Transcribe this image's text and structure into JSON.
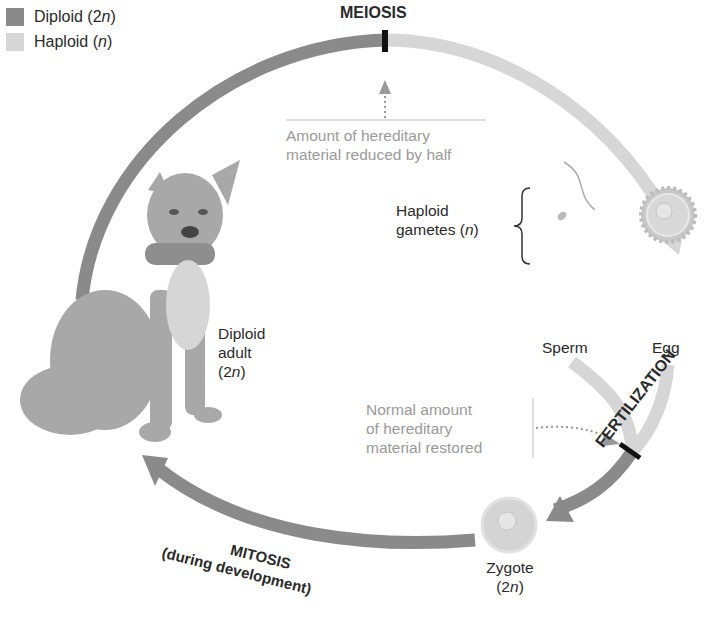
{
  "legend": [
    {
      "label": "Diploid (2",
      "suffix_italic": "n",
      "close": ")",
      "color": "#8a8a8a"
    },
    {
      "label": "Haploid (",
      "suffix_italic": "n",
      "close": ")",
      "color": "#d6d6d6"
    }
  ],
  "stages": {
    "meiosis": "MEIOSIS",
    "fertilization": "FERTILIZATION",
    "mitosis": "MITOSIS",
    "mitosis_sub": "(during development)"
  },
  "notes": {
    "meiosis_note_line1": "Amount of hereditary",
    "meiosis_note_line2": "material reduced by half",
    "fert_note_line1": "Normal amount",
    "fert_note_line2": "of hereditary",
    "fert_note_line3": "material restored"
  },
  "labels": {
    "adult_line1": "Diploid",
    "adult_line2": "adult",
    "adult_line3_pre": "(2",
    "adult_line3_it": "n",
    "adult_line3_post": ")",
    "gametes_line1": "Haploid",
    "gametes_line2_pre": "gametes (",
    "gametes_line2_it": "n",
    "gametes_line2_post": ")",
    "sperm": "Sperm",
    "egg": "Egg",
    "zygote": "Zygote",
    "zygote_ploidy_pre": "(2",
    "zygote_ploidy_it": "n",
    "zygote_ploidy_post": ")"
  },
  "colors": {
    "diploid": "#8a8a8a",
    "haploid": "#d6d6d6",
    "marker": "#111111",
    "note": "#9a9a9a"
  }
}
